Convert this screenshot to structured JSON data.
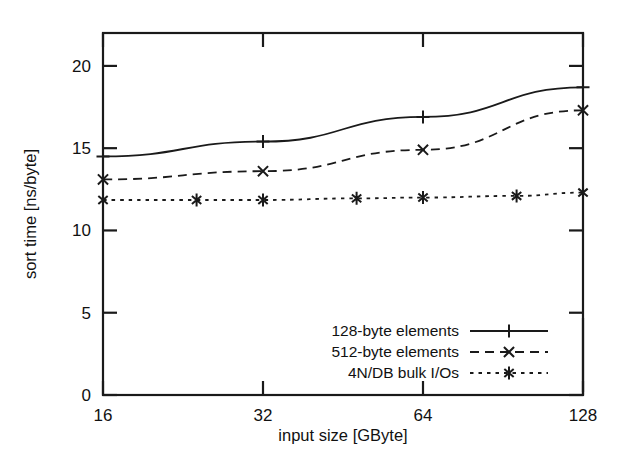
{
  "chart_data": {
    "type": "line",
    "title": "",
    "xlabel": "input size  [GByte]",
    "ylabel": "sort time [ns/byte]",
    "xscale": "log2",
    "xlim": [
      16,
      128
    ],
    "ylim": [
      0,
      22
    ],
    "xticks": [
      16,
      32,
      64,
      128
    ],
    "xtick_labels": [
      "16",
      "32",
      "64",
      "128"
    ],
    "yticks": [
      0,
      5,
      10,
      15,
      20
    ],
    "ytick_labels": [
      "0",
      "5",
      "10",
      "15",
      "20"
    ],
    "grid": false,
    "legend_position": "bottom-right",
    "series": [
      {
        "name": "128-byte elements",
        "marker": "plus",
        "linestyle": "solid",
        "x": [
          16,
          32,
          64,
          128
        ],
        "values": [
          14.5,
          15.4,
          16.9,
          18.7
        ]
      },
      {
        "name": "512-byte elements",
        "marker": "x",
        "linestyle": "dashed",
        "x": [
          16,
          32,
          64,
          128
        ],
        "values": [
          13.1,
          13.6,
          14.9,
          17.3
        ]
      },
      {
        "name": "4N/DB bulk I/Os",
        "marker": "asterisk",
        "linestyle": "dotted",
        "x": [
          16,
          24,
          32,
          48,
          64,
          96,
          128
        ],
        "values": [
          11.85,
          11.85,
          11.85,
          11.95,
          12.0,
          12.1,
          12.3
        ]
      }
    ]
  },
  "legend": {
    "entries": [
      {
        "label": "128-byte elements"
      },
      {
        "label": "512-byte elements"
      },
      {
        "label": "4N/DB bulk I/Os"
      }
    ]
  },
  "axes": {
    "x_title": "input size  [GByte]",
    "y_title": "sort time [ns/byte]"
  }
}
